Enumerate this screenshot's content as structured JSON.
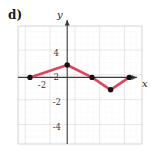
{
  "figure": {
    "part_label": "d)",
    "axis_labels": {
      "x": "x",
      "y": "y"
    },
    "line_color": "#E0445C",
    "point_color": "#111111",
    "grid_minor_color": "#d9d9d9",
    "grid_major_color": "#c2c2c2",
    "axis_color": "#3b3b3b"
  },
  "chart_data": {
    "type": "line",
    "title": "",
    "xlabel": "x",
    "ylabel": "y",
    "xlim": [
      -4,
      6
    ],
    "ylim": [
      -5,
      5
    ],
    "grid": true,
    "grid_minor_step": 0.5,
    "grid_major_step": 2,
    "legend": "none",
    "x_tick_labels": [
      "-2"
    ],
    "x_ticks": [
      -2
    ],
    "y_tick_labels": [
      "4",
      "2",
      "-2",
      "-4"
    ],
    "y_ticks": [
      4,
      2,
      -2,
      -4
    ],
    "series": [
      {
        "name": "piecewise-linear",
        "marker": "filled-circle",
        "x": [
          -3,
          0,
          2,
          3.5,
          5
        ],
        "y": [
          0,
          1,
          0,
          -1,
          0
        ],
        "points": [
          {
            "x": -3,
            "y": 0
          },
          {
            "x": 0,
            "y": 1
          },
          {
            "x": 2,
            "y": 0
          },
          {
            "x": 3.5,
            "y": -1
          },
          {
            "x": 5,
            "y": 0
          }
        ]
      }
    ]
  }
}
